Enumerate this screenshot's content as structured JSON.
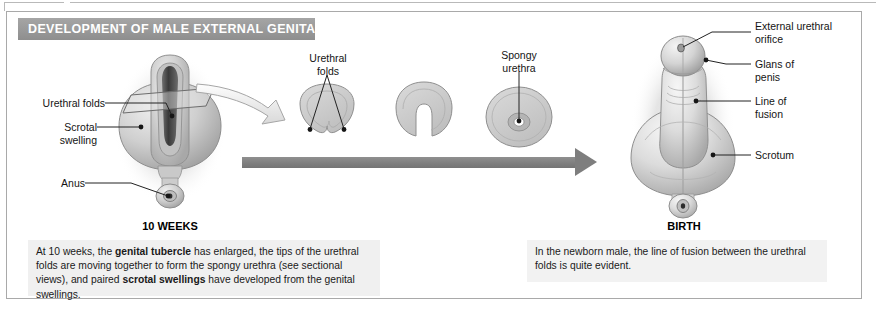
{
  "figure": {
    "banner_title": "DEVELOPMENT OF MALE EXTERNAL GENITALIA",
    "accent_banner_color": "#999999",
    "arrow_color": "#7e7e7e",
    "caption_bg_color": "#f0f0f0",
    "tissue_color": "#c8c8c8",
    "frame_border_color": "#a9a9a9"
  },
  "stages": {
    "left": {
      "title": "10 WEEKS",
      "caption_parts": [
        {
          "text": "At 10 weeks, the ",
          "bold": false
        },
        {
          "text": "genital tubercle",
          "bold": true
        },
        {
          "text": " has enlarged, the tips of the urethral folds are moving together to form the spongy urethra (see sectional views), and paired ",
          "bold": false
        },
        {
          "text": "scrotal swellings",
          "bold": true
        },
        {
          "text": " have developed from the genital swellings.",
          "bold": false
        }
      ]
    },
    "right": {
      "title": "BIRTH",
      "caption": "In the newborn male, the line of fusion between the urethral folds is quite evident."
    }
  },
  "labels": {
    "left_figure": [
      {
        "id": "urethral-folds",
        "line1": "Urethral folds",
        "line2": ""
      },
      {
        "id": "scrotal-swelling",
        "line1": "Scrotal",
        "line2": "swelling"
      },
      {
        "id": "anus",
        "line1": "Anus",
        "line2": ""
      }
    ],
    "sections": [
      {
        "id": "urethral-folds-section",
        "line1": "Urethral",
        "line2": "folds"
      },
      {
        "id": "spongy-urethra-section",
        "line1": "Spongy",
        "line2": "urethra"
      }
    ],
    "right_figure": [
      {
        "id": "external-urethral-orifice",
        "line1": "External urethral",
        "line2": "orifice"
      },
      {
        "id": "glans-of-penis",
        "line1": "Glans of",
        "line2": "penis"
      },
      {
        "id": "line-of-fusion",
        "line1": "Line of",
        "line2": "fusion"
      },
      {
        "id": "scrotum",
        "line1": "Scrotum",
        "line2": ""
      }
    ]
  }
}
